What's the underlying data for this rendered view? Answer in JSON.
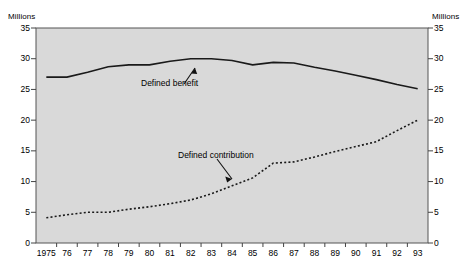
{
  "chart_data": {
    "type": "line",
    "title": "",
    "xlabel": "",
    "ylabel": "Millions",
    "ylabel_right": "Millions",
    "ylim": [
      0,
      35
    ],
    "yticks": [
      0,
      5,
      10,
      15,
      20,
      25,
      30,
      35
    ],
    "grid": false,
    "legend_position": "inline-annotations",
    "plot_background": "#d9d9d9",
    "line_color": "#1a1a1a",
    "categories": [
      "1975",
      "76",
      "77",
      "78",
      "79",
      "80",
      "81",
      "82",
      "83",
      "84",
      "85",
      "86",
      "87",
      "88",
      "89",
      "90",
      "91",
      "92",
      "93"
    ],
    "x": [
      1975,
      1976,
      1977,
      1978,
      1979,
      1980,
      1981,
      1982,
      1983,
      1984,
      1985,
      1986,
      1987,
      1988,
      1989,
      1990,
      1991,
      1992,
      1993
    ],
    "series": [
      {
        "name": "Defined benefit",
        "style": "solid",
        "values": [
          27.0,
          27.0,
          27.8,
          28.7,
          29.0,
          29.0,
          29.6,
          30.0,
          30.0,
          29.7,
          29.0,
          29.4,
          29.3,
          28.6,
          28.0,
          27.3,
          26.6,
          25.8,
          25.1
        ]
      },
      {
        "name": "Defined contribution",
        "style": "dashed",
        "values": [
          4.1,
          4.6,
          5.0,
          5.0,
          5.5,
          5.9,
          6.4,
          7.0,
          8.0,
          9.3,
          10.6,
          13.0,
          13.2,
          14.0,
          14.9,
          15.7,
          16.5,
          18.3,
          20.0
        ]
      }
    ],
    "annotations": [
      {
        "text": "Defined benefit",
        "points_to_series": "Defined benefit"
      },
      {
        "text": "Defined contribution",
        "points_to_series": "Defined contribution"
      }
    ]
  },
  "axes": {
    "left_title": "Millions",
    "right_title": "Millions",
    "ytick_labels": [
      "35",
      "30",
      "25",
      "20",
      "15",
      "10",
      "5",
      "0"
    ],
    "xtick_labels": [
      "1975",
      "76",
      "77",
      "78",
      "79",
      "80",
      "81",
      "82",
      "83",
      "84",
      "85",
      "86",
      "87",
      "88",
      "89",
      "90",
      "91",
      "92",
      "93"
    ]
  },
  "labels": {
    "defined_benefit": "Defined benefit",
    "defined_contribution": "Defined contribution"
  }
}
